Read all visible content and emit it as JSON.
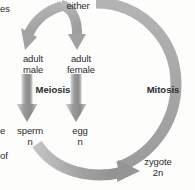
{
  "diagram": {
    "background_color": "#fdfdfc",
    "arrow_color": "#a8a8a8",
    "arrow_color_dark": "#8d8d8d",
    "text_color": "#2c2c2c",
    "labels": {
      "either": "either",
      "adult_male": "adult\nmale",
      "adult_female": "adult\nfemale",
      "meiosis": "Meiosis",
      "mitosis": "Mitosis",
      "sperm": "sperm\nn",
      "egg": "egg\nn",
      "zygote": "zygote\n2n"
    },
    "edge_fragments": {
      "top_left": "es",
      "mid_left": "e",
      "lower_left": "of"
    },
    "arrows": [
      {
        "name": "branch-to-adult-male",
        "from": "either",
        "to": "adult male",
        "style": "curved-down-left"
      },
      {
        "name": "branch-to-adult-female",
        "from": "either",
        "to": "adult female",
        "style": "curved-down"
      },
      {
        "name": "meiosis-male",
        "from": "adult male",
        "to": "sperm",
        "style": "straight-down-thick"
      },
      {
        "name": "meiosis-female",
        "from": "adult female",
        "to": "egg",
        "style": "straight-down-thick"
      },
      {
        "name": "fertilization",
        "from": "sperm and egg",
        "to": "zygote",
        "style": "curved-right"
      },
      {
        "name": "mitosis-cycle",
        "from": "zygote",
        "to": "either",
        "style": "large-arc-clockwise"
      }
    ]
  }
}
